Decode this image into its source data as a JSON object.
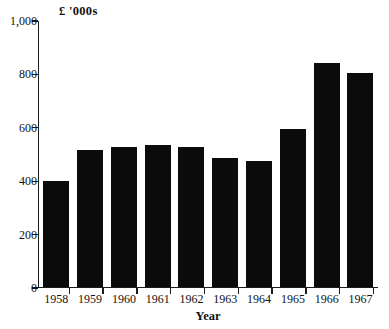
{
  "chart_data": {
    "type": "bar",
    "title": "",
    "subtitle": "",
    "xlabel": "Year",
    "ylabel": "£ '000s",
    "categories": [
      "1958",
      "1959",
      "1960",
      "1961",
      "1962",
      "1963",
      "1964",
      "1965",
      "1966",
      "1967"
    ],
    "values": [
      400,
      515,
      525,
      535,
      525,
      485,
      475,
      595,
      845,
      805
    ],
    "series": [
      {
        "name": "Value",
        "values": [
          400,
          515,
          525,
          535,
          525,
          485,
          475,
          595,
          845,
          805
        ]
      }
    ],
    "ylim": [
      0,
      1000
    ],
    "y_ticks": [
      0,
      200,
      400,
      600,
      800,
      1000
    ],
    "y_tick_labels": [
      "0",
      "200",
      "400",
      "600",
      "800",
      "1,000"
    ],
    "grid": false,
    "legend": false,
    "legend_position": "none",
    "bar_color": "#0b0b0b",
    "axis_color": "#1b1b1b",
    "background_color": "#ffffff",
    "annotations": []
  },
  "axes": {
    "y_unit_caption": "£ '000s",
    "x_axis_title": "Year"
  }
}
